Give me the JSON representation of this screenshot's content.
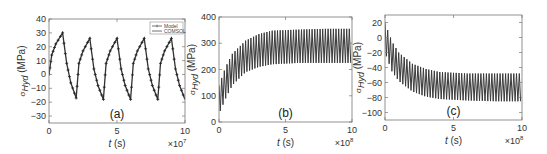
{
  "chart_data": [
    {
      "type": "line",
      "panel_label": "(a)",
      "xlabel": "t (s)",
      "ylabel": "σ_Hyd (MPa)",
      "x_multiplier": "×10^7",
      "xlim": [
        0,
        10
      ],
      "ylim": [
        -35,
        40
      ],
      "xticks": [
        0,
        5,
        10
      ],
      "yticks": [
        40,
        30,
        20,
        10,
        0,
        -10,
        -20,
        -30
      ],
      "legend": [
        "Model",
        "COMSOL"
      ],
      "legend_position": "upper right",
      "grid": false,
      "series": [
        {
          "name": "Model",
          "marker": "+",
          "x": [
            0,
            0.2,
            0.5,
            1.0,
            1.3,
            1.6,
            2.0,
            2.2,
            2.5,
            3.0,
            3.3,
            3.6,
            4.0,
            4.2,
            4.5,
            5.0,
            5.3,
            5.6,
            6.0,
            6.2,
            6.5,
            7.0,
            7.3,
            7.6,
            8.0,
            8.2,
            8.5,
            9.0,
            9.3,
            9.6,
            10.0
          ],
          "y": [
            0,
            14,
            22,
            30,
            8,
            -6,
            -17,
            8,
            17,
            26,
            4,
            -8,
            -18,
            8,
            17,
            26,
            4,
            -8,
            -18,
            8,
            17,
            26,
            4,
            -8,
            -18,
            8,
            17,
            26,
            4,
            -8,
            -18
          ]
        },
        {
          "name": "COMSOL",
          "x": [
            0,
            0.2,
            0.5,
            1.0,
            1.3,
            1.6,
            2.0,
            2.2,
            2.5,
            3.0,
            3.3,
            3.6,
            4.0,
            4.2,
            4.5,
            5.0,
            5.3,
            5.6,
            6.0,
            6.2,
            6.5,
            7.0,
            7.3,
            7.6,
            8.0,
            8.2,
            8.5,
            9.0,
            9.3,
            9.6,
            10.0
          ],
          "y": [
            0,
            14,
            22,
            30,
            8,
            -6,
            -17,
            8,
            17,
            26,
            4,
            -8,
            -18,
            8,
            17,
            26,
            4,
            -8,
            -18,
            8,
            17,
            26,
            4,
            -8,
            -18,
            8,
            17,
            26,
            4,
            -8,
            -18
          ]
        }
      ]
    },
    {
      "type": "line",
      "panel_label": "(b)",
      "xlabel": "t (s)",
      "ylabel": "σ_Hyd (MPa)",
      "x_multiplier": "×10^8",
      "xlim": [
        0,
        10
      ],
      "ylim": [
        0,
        400
      ],
      "xticks": [
        0,
        5,
        10
      ],
      "yticks": [
        400,
        300,
        200,
        100,
        0
      ],
      "grid": false,
      "description": "Rapid oscillation (~50 cycles); upper envelope rises from ~140 to ~355, lower envelope rises from ~30 to ~225, saturating after t≈4",
      "envelope": {
        "x": [
          0,
          0.5,
          1,
          2,
          3,
          4,
          6,
          8,
          10
        ],
        "upper": [
          140,
          210,
          260,
          310,
          335,
          348,
          352,
          355,
          355
        ],
        "lower": [
          30,
          90,
          140,
          190,
          210,
          220,
          225,
          225,
          225
        ]
      }
    },
    {
      "type": "line",
      "panel_label": "(c)",
      "xlabel": "t (s)",
      "ylabel": "σ_Hyd (MPa)",
      "x_multiplier": "×10^8",
      "xlim": [
        0,
        10
      ],
      "ylim": [
        -110,
        30
      ],
      "xticks": [
        0,
        5,
        10
      ],
      "yticks": [
        20,
        0,
        -20,
        -40,
        -60,
        -80,
        -100
      ],
      "grid": false,
      "description": "Rapid oscillation (~50 cycles); upper envelope decays from ~20 to ~-48, lower envelope decays from ~-20 to ~-85, saturating after t≈4",
      "envelope": {
        "x": [
          0,
          0.5,
          1,
          2,
          3,
          4,
          6,
          8,
          10
        ],
        "upper": [
          20,
          -5,
          -20,
          -35,
          -42,
          -46,
          -48,
          -48,
          -48
        ],
        "lower": [
          -20,
          -45,
          -58,
          -72,
          -79,
          -82,
          -84,
          -85,
          -85
        ]
      }
    }
  ]
}
